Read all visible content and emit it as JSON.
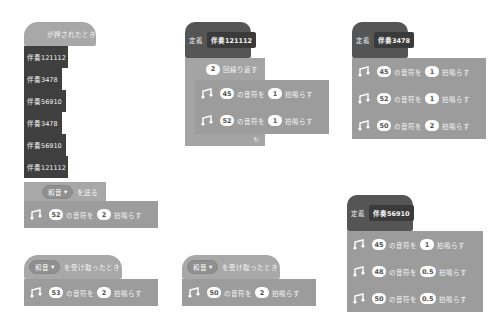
{
  "colors": {
    "event": "#a8a8a8",
    "music": "#9c9c9c",
    "control": "#a4a4a4",
    "define": "#555555",
    "call": "#3f3f3f"
  },
  "scripts": {
    "main": {
      "hat_label": "が押されたとき",
      "calls": [
        "伴奏121112",
        "伴奏3478",
        "伴奏56910",
        "伴奏3478",
        "伴奏56910",
        "伴奏121112"
      ],
      "broadcast": {
        "menu": "和音",
        "label": "を送る"
      },
      "note": {
        "note": "52",
        "mid": "の音符を",
        "beats": "2",
        "end": "拍鳴らす"
      }
    },
    "recv1": {
      "menu": "和音",
      "label": "を受け取ったとき",
      "note": {
        "note": "53",
        "mid": "の音符を",
        "beats": "2",
        "end": "拍鳴らす"
      }
    },
    "recv2": {
      "menu": "和音",
      "label": "を受け取ったとき",
      "note": {
        "note": "50",
        "mid": "の音符を",
        "beats": "2",
        "end": "拍鳴らす"
      }
    },
    "def121112": {
      "define": "定義",
      "name": "伴奏121112",
      "repeat": {
        "count": "2",
        "label": "回繰り返す"
      },
      "notes": [
        {
          "note": "45",
          "mid": "の音符を",
          "beats": "1",
          "end": "拍鳴らす"
        },
        {
          "note": "52",
          "mid": "の音符を",
          "beats": "1",
          "end": "拍鳴らす"
        }
      ],
      "loop_arrow": "↻"
    },
    "def3478": {
      "define": "定義",
      "name": "伴奏3478",
      "notes": [
        {
          "note": "45",
          "mid": "の音符を",
          "beats": "1",
          "end": "拍鳴らす"
        },
        {
          "note": "52",
          "mid": "の音符を",
          "beats": "1",
          "end": "拍鳴らす"
        },
        {
          "note": "50",
          "mid": "の音符を",
          "beats": "2",
          "end": "拍鳴らす"
        }
      ]
    },
    "def56910": {
      "define": "定義",
      "name": "伴奏56910",
      "notes": [
        {
          "note": "45",
          "mid": "の音符を",
          "beats": "1",
          "end": "拍鳴らす"
        },
        {
          "note": "48",
          "mid": "の音符を",
          "beats": "0.5",
          "end": "拍鳴らす"
        },
        {
          "note": "50",
          "mid": "の音符を",
          "beats": "0.5",
          "end": "拍鳴らす"
        }
      ]
    }
  }
}
